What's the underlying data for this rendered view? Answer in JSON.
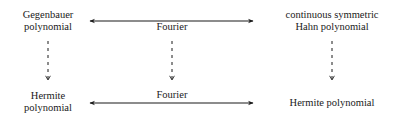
{
  "diagram": {
    "top_row": {
      "left": {
        "line1": "Gegenbauer",
        "line2": "polynomial"
      },
      "center_label": "Fourier",
      "right": {
        "line1": "continuous symmetric",
        "line2": "Hahn polynomial"
      }
    },
    "bottom_row": {
      "left": {
        "line1": "Hermite",
        "line2": "polynomial"
      },
      "center_label": "Fourier",
      "right": {
        "line1": "Hermite polynomial"
      }
    },
    "edges": [
      {
        "from": "Gegenbauer polynomial",
        "to": "continuous symmetric Hahn polynomial",
        "label": "Fourier",
        "style": "solid",
        "direction": "both"
      },
      {
        "from": "Hermite polynomial (left)",
        "to": "Hermite polynomial (right)",
        "label": "Fourier",
        "style": "solid",
        "direction": "both"
      },
      {
        "from": "Gegenbauer polynomial",
        "to": "Hermite polynomial (left)",
        "style": "dashed",
        "direction": "down"
      },
      {
        "from": "Fourier (top)",
        "to": "Fourier (bottom)",
        "style": "dashed",
        "direction": "down"
      },
      {
        "from": "continuous symmetric Hahn polynomial",
        "to": "Hermite polynomial (right)",
        "style": "dashed",
        "direction": "down"
      }
    ]
  }
}
